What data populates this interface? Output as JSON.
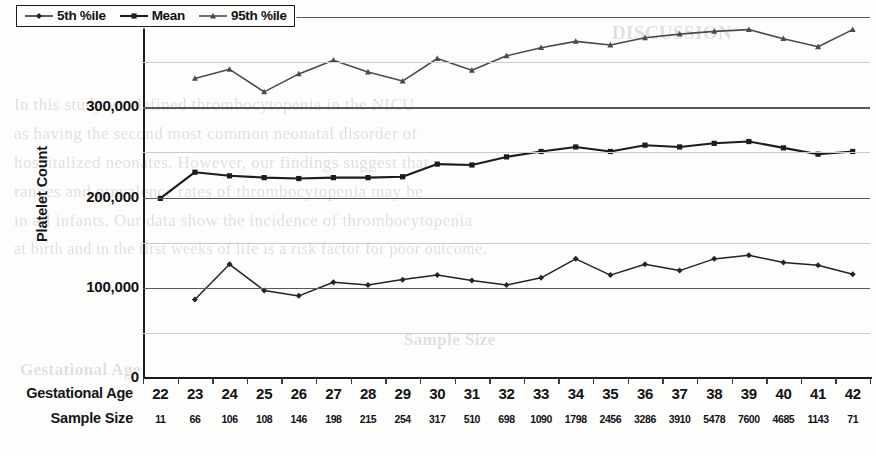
{
  "figure": {
    "y_axis_title": "Platelet Count",
    "y_tick_labels": [
      "400,000",
      "300,000",
      "200,000",
      "100,000",
      "0"
    ],
    "row_headers": {
      "gestational_age": "Gestational Age",
      "sample_size": "Sample Size"
    },
    "legend": [
      {
        "label": "5th %ile",
        "marker": "diamond"
      },
      {
        "label": "Mean",
        "marker": "square"
      },
      {
        "label": "95th %ile",
        "marker": "triangle"
      }
    ]
  },
  "colors": {
    "ink": "#1a1a1f",
    "series_5th": "#232329",
    "series_mean": "#1b1b20",
    "series_95th": "#4a4a52",
    "gridline_major": "#58585f",
    "gridline_minor": "#cacace",
    "page": "#fdfdfb"
  },
  "ghost_text": [
    {
      "text": "DISCUSSION",
      "x": 612,
      "y": 22,
      "size": 19,
      "weight": "bold"
    },
    {
      "text": "In this study we defined thrombocytopenia in the NICU",
      "x": 14,
      "y": 95,
      "size": 17
    },
    {
      "text": "as having the second most common neonatal disorder of",
      "x": 14,
      "y": 124,
      "size": 17
    },
    {
      "text": "hospitalized neonates. However, our findings suggest that",
      "x": 14,
      "y": 153,
      "size": 17
    },
    {
      "text": "ranges and prevalence rates of thrombocytopenia may be",
      "x": 14,
      "y": 182,
      "size": 17
    },
    {
      "text": "in all infants. Our data show the incidence of thrombocytopenia",
      "x": 14,
      "y": 211,
      "size": 17
    },
    {
      "text": "at birth and in the first weeks of life is a risk factor for poor outcome.",
      "x": 14,
      "y": 240,
      "size": 16
    },
    {
      "text": "Sample Size",
      "x": 404,
      "y": 330,
      "size": 17,
      "weight": "bold"
    },
    {
      "text": "Gestational Age",
      "x": 20,
      "y": 360,
      "size": 17,
      "weight": "bold"
    }
  ],
  "chart_data": {
    "type": "line",
    "title": "",
    "xlabel": "Gestational Age",
    "ylabel": "Platelet Count",
    "ylim": [
      0,
      400000
    ],
    "ytick_interval": 100000,
    "minor_gridline_interval": 50000,
    "grid": true,
    "legend_position": "top-left-inside",
    "categories": [
      22,
      23,
      24,
      25,
      26,
      27,
      28,
      29,
      30,
      31,
      32,
      33,
      34,
      35,
      36,
      37,
      38,
      39,
      40,
      41,
      42
    ],
    "sample_size": [
      11,
      66,
      106,
      108,
      146,
      198,
      215,
      254,
      317,
      510,
      698,
      1090,
      1798,
      2456,
      3286,
      3910,
      5478,
      7600,
      4685,
      1143,
      71
    ],
    "series": [
      {
        "name": "5th %ile",
        "values": [
          null,
          87000,
          126000,
          97000,
          91000,
          106000,
          103000,
          109000,
          114000,
          108000,
          103000,
          111000,
          132000,
          114000,
          126000,
          119000,
          132000,
          136000,
          128000,
          125000,
          115000
        ]
      },
      {
        "name": "Mean",
        "values": [
          199000,
          228000,
          224000,
          222000,
          221000,
          222000,
          222000,
          223000,
          237000,
          236000,
          245000,
          251000,
          256000,
          251000,
          258000,
          256000,
          260000,
          262000,
          255000,
          248000,
          251000
        ]
      },
      {
        "name": "95th %ile",
        "values": [
          null,
          332000,
          342000,
          317000,
          337000,
          352000,
          339000,
          329000,
          354000,
          341000,
          357000,
          366000,
          373000,
          369000,
          377000,
          381000,
          384000,
          386000,
          376000,
          367000,
          386000
        ]
      }
    ]
  }
}
